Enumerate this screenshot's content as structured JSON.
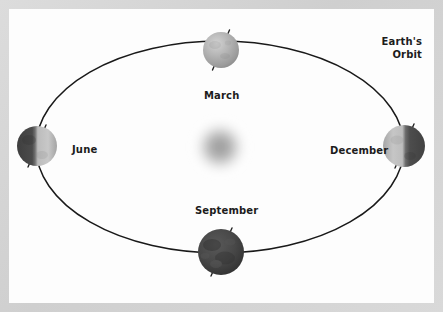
{
  "figure": {
    "frame_color": "#d5d5d5",
    "canvas_color": "#fdfdfd"
  },
  "annotations": {
    "orbit_label_line1": "Earth's",
    "orbit_label_line2": "Orbit"
  },
  "sun": {
    "name": "sun",
    "cx": 211,
    "cy": 138,
    "radius": 26,
    "color": "#9a9a9a"
  },
  "orbit": {
    "name": "earth-orbit-ellipse",
    "cx": 211,
    "cy": 138,
    "rx": 184,
    "ry": 106,
    "stroke": "#191919",
    "stroke_width": 1.5
  },
  "positions": [
    {
      "id": "march",
      "label": "March",
      "cx": 212,
      "cy": 41,
      "radius": 18,
      "lit_side": "full",
      "light_color": "#b6b6b6",
      "dark_color": "#8d8d8d",
      "axis_tilt_deg": 23.5
    },
    {
      "id": "june",
      "label": "June",
      "cx": 28,
      "cy": 137,
      "radius": 20,
      "lit_side": "right",
      "light_color": "#c2c2c2",
      "dark_color": "#4e4e4e",
      "axis_tilt_deg": 23.5
    },
    {
      "id": "september",
      "label": "September",
      "cx": 212,
      "cy": 243,
      "radius": 23,
      "lit_side": "none",
      "light_color": "#4a4a4a",
      "dark_color": "#2e2e2e",
      "axis_tilt_deg": 23.5
    },
    {
      "id": "december",
      "label": "December",
      "cx": 395,
      "cy": 137,
      "radius": 21,
      "lit_side": "left",
      "light_color": "#bdbdbd",
      "dark_color": "#4a4a4a",
      "axis_tilt_deg": 23.5
    }
  ]
}
